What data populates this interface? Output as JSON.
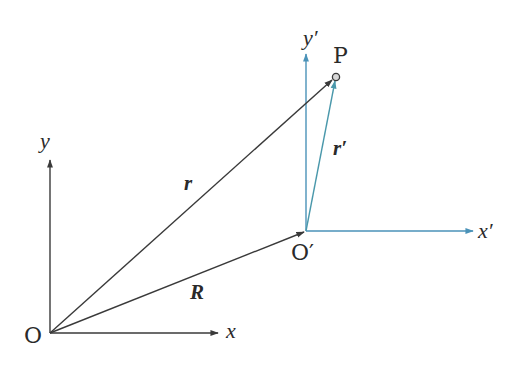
{
  "colors": {
    "black_axes": "#3a3a3a",
    "primed_axes": "#4a92b8",
    "r_prime_vector": "#4a98ab",
    "point_fill": "#d8d8d8"
  },
  "points": {
    "O": {
      "x": 50,
      "y": 333
    },
    "O_prime": {
      "x": 306,
      "y": 231
    },
    "P": {
      "x": 336,
      "y": 77
    }
  },
  "labels": {
    "origin": "O",
    "origin_prime": "O′",
    "x_axis": "x",
    "y_axis": "y",
    "x_prime_axis": "x′",
    "y_prime_axis": "y′",
    "point": "P",
    "vector_r": "r",
    "vector_R": "R",
    "vector_r_prime": "r′"
  }
}
